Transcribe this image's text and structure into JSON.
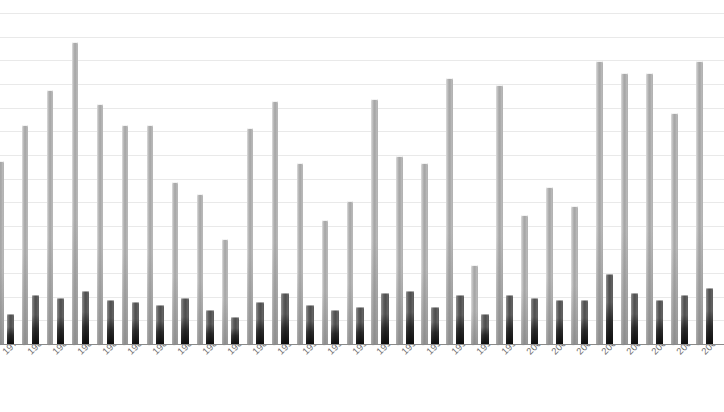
{
  "chart_data": {
    "type": "bar",
    "title": "",
    "subtitle": "",
    "xlabel": "",
    "ylabel": "",
    "grid": true,
    "legend_position": "none",
    "axis_tick_rotation": -45,
    "ylim": [
      0,
      14
    ],
    "gridline_count": 14,
    "categories": [
      "1979",
      "1980",
      "1981",
      "1982",
      "1983",
      "1984",
      "1985",
      "1986",
      "1987",
      "1988",
      "1989",
      "1990",
      "1991",
      "1992",
      "1993",
      "1994",
      "1995",
      "1996",
      "1997",
      "1998",
      "1999",
      "2000",
      "2001",
      "2002",
      "2003",
      "2004",
      "2005",
      "2006",
      "2007"
    ],
    "series": [
      {
        "name": "series-light",
        "color": "#b0b0b0",
        "values": [
          7.8,
          9.3,
          10.8,
          12.8,
          10.2,
          9.3,
          9.3,
          6.9,
          6.4,
          4.5,
          9.2,
          10.3,
          7.7,
          5.3,
          6.1,
          10.4,
          8.0,
          7.7,
          11.3,
          3.4,
          11.0,
          5.5,
          6.7,
          5.9,
          12.0,
          11.5,
          11.5,
          9.8,
          12.0
        ]
      },
      {
        "name": "series-dark",
        "color": "#4e4e4e",
        "values": [
          1.3,
          2.1,
          2.0,
          2.3,
          1.9,
          1.8,
          1.7,
          2.0,
          1.5,
          1.2,
          1.8,
          2.2,
          1.7,
          1.5,
          1.6,
          2.2,
          2.3,
          1.6,
          2.1,
          1.3,
          2.1,
          2.0,
          1.9,
          1.9,
          3.0,
          2.2,
          1.9,
          2.1,
          2.4
        ]
      }
    ]
  },
  "colors": {
    "bar_light": "#b0b0b0",
    "bar_dark": "#4e4e4e",
    "gridline": "#e9e9e9",
    "axis": "#8a8a8a",
    "tick_label": "#707070",
    "background": "#ffffff"
  }
}
